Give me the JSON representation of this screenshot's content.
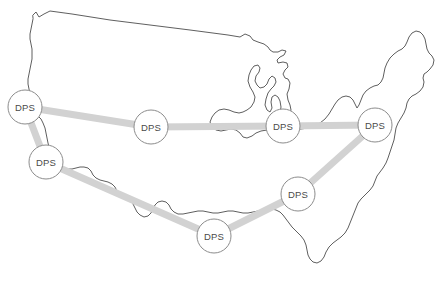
{
  "figure": {
    "region_name": "United States",
    "background_color": "#ffffff",
    "outline_color": "#4d4d4d",
    "link_color": "#d2d2d2",
    "node_fill_color": "#ffffff",
    "node_stroke_color": "#8c8c8c",
    "node_text_color": "#4a4a4a"
  },
  "nodes": [
    {
      "id": "dps-northwest",
      "label": "DPS",
      "x": 25,
      "y": 107,
      "r": 17
    },
    {
      "id": "dps-west",
      "label": "DPS",
      "x": 46,
      "y": 162,
      "r": 17
    },
    {
      "id": "dps-north-central",
      "label": "DPS",
      "x": 151,
      "y": 127,
      "r": 17
    },
    {
      "id": "dps-midwest-east",
      "label": "DPS",
      "x": 283,
      "y": 126,
      "r": 17
    },
    {
      "id": "dps-northeast",
      "label": "DPS",
      "x": 375,
      "y": 125,
      "r": 17
    },
    {
      "id": "dps-southeast",
      "label": "DPS",
      "x": 298,
      "y": 194,
      "r": 17
    },
    {
      "id": "dps-south-central",
      "label": "DPS",
      "x": 214,
      "y": 236,
      "r": 17
    }
  ],
  "links": [
    {
      "id": "link-northwest-north-central",
      "from": "dps-northwest",
      "to": "dps-north-central"
    },
    {
      "id": "link-north-central-midwest",
      "from": "dps-north-central",
      "to": "dps-midwest-east"
    },
    {
      "id": "link-midwest-northeast",
      "from": "dps-midwest-east",
      "to": "dps-northeast"
    },
    {
      "id": "link-northwest-west",
      "from": "dps-northwest",
      "to": "dps-west"
    },
    {
      "id": "link-west-south-central",
      "from": "dps-west",
      "to": "dps-south-central"
    },
    {
      "id": "link-south-central-southeast",
      "from": "dps-south-central",
      "to": "dps-southeast"
    },
    {
      "id": "link-southeast-northeast",
      "from": "dps-southeast",
      "to": "dps-northeast"
    }
  ],
  "outline_path": "M 33 15 L 36 12 L 39 17 L 44 14 L 50 11 L 72 14 L 110 20 L 150 25 L 190 30 L 228 35 L 240 37 L 245 34 L 250 36 L 253 40 L 258 42 L 264 44 L 268 47 L 270 50 L 273 52 L 278 52 L 282 50 L 286 51 L 284 55 L 280 57 L 277 60 L 278 63 L 283 62 L 287 63 L 288 67 L 285 70 L 283 74 L 285 78 L 288 79 L 290 83 L 289 89 L 287 94 L 288 100 L 290 105 L 291 110 L 289 115 L 286 118 L 283 120 L 281 118 L 280 113 L 281 107 L 280 101 L 278 97 L 275 95 L 272 97 L 271 102 L 272 108 L 270 112 L 267 110 L 265 105 L 266 99 L 268 93 L 271 89 L 274 86 L 276 82 L 275 78 L 272 76 L 269 79 L 267 84 L 264 87 L 260 88 L 257 85 L 255 81 L 256 76 L 259 72 L 260 68 L 258 65 L 254 66 L 251 70 L 249 75 L 248 81 L 250 87 L 253 92 L 255 97 L 254 102 L 251 107 L 247 110 L 243 112 L 239 113 L 234 112 L 229 110 L 224 109 L 219 110 L 215 113 L 212 117 L 210 122 L 212 127 L 216 130 L 221 131 L 226 130 L 231 129 L 236 130 L 240 133 L 243 137 L 247 138 L 252 136 L 256 133 L 261 131 L 267 130 L 273 130 L 280 131 L 287 131 L 294 130 L 301 129 L 308 128 L 314 126 L 320 123 L 325 119 L 329 114 L 332 109 L 335 104 L 338 100 L 342 97 L 346 96 L 350 97 L 353 100 L 355 104 L 357 108 L 359 105 L 361 100 L 363 95 L 366 91 L 370 88 L 374 86 L 378 85 L 381 82 L 383 78 L 384 73 L 385 68 L 387 63 L 390 58 L 394 54 L 398 51 L 402 49 L 405 46 L 407 42 L 409 37 L 412 33 L 416 31 L 420 32 L 423 35 L 425 39 L 426 44 L 427 49 L 429 53 L 432 56 L 434 60 L 433 65 L 430 69 L 427 72 L 424 74 L 423 78 L 424 82 L 423 87 L 420 91 L 416 94 L 412 96 L 409 99 L 407 103 L 406 108 L 404 113 L 401 118 L 398 123 L 396 128 L 395 134 L 394 140 L 392 146 L 390 152 L 388 158 L 386 163 L 383 168 L 380 172 L 377 176 L 375 181 L 373 186 L 370 190 L 367 193 L 364 196 L 361 199 L 358 203 L 356 208 L 354 213 L 352 218 L 350 223 L 348 228 L 345 233 L 341 237 L 337 240 L 333 243 L 329 247 L 326 252 L 324 257 L 321 261 L 317 263 L 313 262 L 310 259 L 308 255 L 307 250 L 306 245 L 304 240 L 301 236 L 298 233 L 295 230 L 292 227 L 289 223 L 286 219 L 283 215 L 280 212 L 276 210 L 272 209 L 268 209 L 263 210 L 258 211 L 253 212 L 248 213 L 243 213 L 238 212 L 233 211 L 228 211 L 223 212 L 218 213 L 213 213 L 208 212 L 203 211 L 198 211 L 193 212 L 188 213 L 183 214 L 178 214 L 174 212 L 171 209 L 169 205 L 166 202 L 162 201 L 158 202 L 155 205 L 153 209 L 151 213 L 148 216 L 144 217 L 140 215 L 137 212 L 135 208 L 133 204 L 130 201 L 126 199 L 122 198 L 119 195 L 117 191 L 115 187 L 112 184 L 108 182 L 104 181 L 100 180 L 96 178 L 93 175 L 91 171 L 88 168 L 84 167 L 80 167 L 76 168 L 72 169 L 68 169 L 64 168 L 61 165 L 59 161 L 57 157 L 54 154 L 51 151 L 49 147 L 48 143 L 47 138 L 46 133 L 45 128 L 43 123 L 41 119 L 38 116 L 35 113 L 33 109 L 32 104 L 31 99 L 30 94 L 29 89 L 28 84 L 28 79 L 29 74 L 30 69 L 31 64 L 32 59 L 32 54 L 32 49 L 31 44 L 30 39 L 30 34 L 31 29 L 32 24 L 33 19 Z"
}
